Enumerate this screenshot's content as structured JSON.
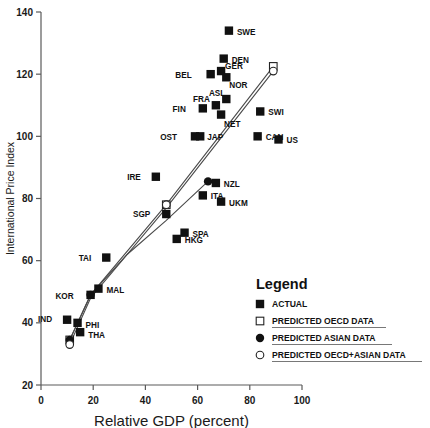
{
  "chart_data": {
    "type": "scatter",
    "title": "",
    "xlabel": "Relative GDP (percent)",
    "ylabel": "International Price Index",
    "xlim": [
      0,
      100
    ],
    "ylim": [
      20,
      140
    ],
    "xticks": [
      "0",
      "20",
      "40",
      "60",
      "80",
      "100"
    ],
    "yticks": [
      "20",
      "40",
      "60",
      "80",
      "100",
      "120",
      "140"
    ],
    "grid": false,
    "legend": {
      "title": "Legend",
      "position": "lower-right",
      "entries": [
        {
          "label": "ACTUAL",
          "marker": "filled-square"
        },
        {
          "label": "PREDICTED OECD DATA",
          "marker": "open-square"
        },
        {
          "label": "PREDICTED ASIAN DATA",
          "marker": "filled-circle"
        },
        {
          "label": "PREDICTED OECD+ASIAN DATA",
          "marker": "open-circle"
        }
      ]
    },
    "series": [
      {
        "name": "ACTUAL",
        "marker": "filled-square",
        "points": [
          {
            "label": "SWE",
            "x": 72,
            "y": 134,
            "lx": 8,
            "ly": 1
          },
          {
            "label": "DEN",
            "x": 70,
            "y": 125,
            "lx": 8,
            "ly": 1
          },
          {
            "label": "GER",
            "x": 69,
            "y": 121,
            "lx": 4,
            "ly": -5
          },
          {
            "label": "NOR",
            "x": 71,
            "y": 119,
            "lx": 3,
            "ly": 8
          },
          {
            "label": "BEL",
            "x": 65,
            "y": 120,
            "lx": -19,
            "ly": 1
          },
          {
            "label": "ASL",
            "x": 71,
            "y": 112,
            "lx": -1,
            "ly": -6
          },
          {
            "label": "FRA",
            "x": 67,
            "y": 110,
            "lx": -6,
            "ly": -6
          },
          {
            "label": "FIN",
            "x": 62,
            "y": 109,
            "lx": -17,
            "ly": 1
          },
          {
            "label": "NET",
            "x": 69,
            "y": 107,
            "lx": 3,
            "ly": 9
          },
          {
            "label": "SWI",
            "x": 84,
            "y": 108,
            "lx": 8,
            "ly": 1
          },
          {
            "label": "CAN",
            "x": 83,
            "y": 100,
            "lx": 8,
            "ly": 1
          },
          {
            "label": "US",
            "x": 91,
            "y": 99,
            "lx": 8,
            "ly": 1
          },
          {
            "label": "OST",
            "x": 59,
            "y": 100,
            "lx": -18,
            "ly": 1
          },
          {
            "label": "JAP",
            "x": 61,
            "y": 100,
            "lx": 7,
            "ly": 1
          },
          {
            "label": "IRE",
            "x": 44,
            "y": 87,
            "lx": -15,
            "ly": 0
          },
          {
            "label": "NZL",
            "x": 67,
            "y": 85,
            "lx": 8,
            "ly": 1
          },
          {
            "label": "ITA",
            "x": 62,
            "y": 81,
            "lx": 8,
            "ly": 1
          },
          {
            "label": "UKM",
            "x": 69,
            "y": 79,
            "lx": 8,
            "ly": 1
          },
          {
            "label": "SGP",
            "x": 48,
            "y": 75,
            "lx": -16,
            "ly": 0
          },
          {
            "label": "SPA",
            "x": 55,
            "y": 69,
            "lx": 8,
            "ly": 1
          },
          {
            "label": "HKG",
            "x": 52,
            "y": 67,
            "lx": 8,
            "ly": 1
          },
          {
            "label": "TAI",
            "x": 25,
            "y": 61,
            "lx": -15,
            "ly": 0
          },
          {
            "label": "MAL",
            "x": 22,
            "y": 51,
            "lx": 8,
            "ly": 1
          },
          {
            "label": "KOR",
            "x": 19,
            "y": 49,
            "lx": -17,
            "ly": 1
          },
          {
            "label": "IND",
            "x": 10,
            "y": 41,
            "lx": -15,
            "ly": -1
          },
          {
            "label": "PHI",
            "x": 14,
            "y": 40,
            "lx": 8,
            "ly": 2
          },
          {
            "label": "THA",
            "x": 15,
            "y": 37,
            "lx": 8,
            "ly": 3
          }
        ]
      },
      {
        "name": "PREDICTED OECD DATA",
        "marker": "open-square",
        "points": [
          {
            "label": "",
            "x": 11,
            "y": 34.5,
            "lx": 0,
            "ly": 0
          },
          {
            "label": "",
            "x": 48,
            "y": 78,
            "lx": 0,
            "ly": 0
          },
          {
            "label": "",
            "x": 89,
            "y": 122.5,
            "lx": 0,
            "ly": 0
          }
        ]
      },
      {
        "name": "PREDICTED ASIAN DATA",
        "marker": "filled-circle",
        "points": [
          {
            "label": "",
            "x": 11,
            "y": 34.5,
            "lx": 0,
            "ly": 0
          },
          {
            "label": "",
            "x": 19,
            "y": 49,
            "lx": 0,
            "ly": 0
          },
          {
            "label": "",
            "x": 64,
            "y": 85.5,
            "lx": 0,
            "ly": 0
          }
        ]
      },
      {
        "name": "PREDICTED OECD+ASIAN DATA",
        "marker": "open-circle",
        "points": [
          {
            "label": "",
            "x": 11,
            "y": 33,
            "lx": 0,
            "ly": 0
          },
          {
            "label": "",
            "x": 48,
            "y": 78,
            "lx": 0,
            "ly": 0
          },
          {
            "label": "",
            "x": 89,
            "y": 121,
            "lx": 0,
            "ly": 0
          }
        ]
      }
    ],
    "trend_lines": [
      {
        "name": "oecd-line",
        "points": [
          [
            11,
            34.5
          ],
          [
            19,
            49
          ],
          [
            48,
            78
          ],
          [
            89,
            122.5
          ]
        ]
      },
      {
        "name": "oecd-asian-line",
        "points": [
          [
            11,
            33
          ],
          [
            19,
            48
          ],
          [
            48,
            77
          ],
          [
            89,
            121
          ]
        ]
      },
      {
        "name": "asian-line",
        "points": [
          [
            11,
            34.5
          ],
          [
            19,
            49
          ],
          [
            33,
            62
          ],
          [
            48,
            73
          ],
          [
            64,
            85.5
          ]
        ]
      }
    ]
  }
}
